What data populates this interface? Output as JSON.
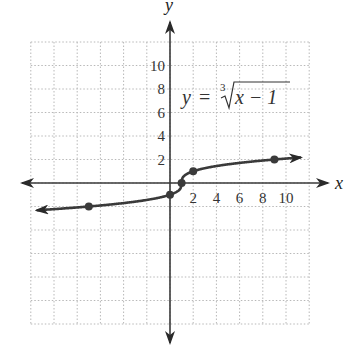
{
  "chart_data": {
    "type": "line",
    "title": "",
    "equation_label": {
      "lhs": "y",
      "equals": "=",
      "index": "3",
      "radicand": "x − 1",
      "full": "y = ∛(x − 1)"
    },
    "xlabel": "x",
    "ylabel": "y",
    "xlim": [
      -12,
      12
    ],
    "ylim": [
      -12,
      12
    ],
    "grid": true,
    "grid_style": "dotted",
    "grid_step": 2,
    "x_ticks": [
      2,
      4,
      6,
      8,
      10
    ],
    "x_tick_labels": [
      "2",
      "4",
      "6",
      "8",
      "10"
    ],
    "y_ticks": [
      2,
      4,
      6,
      8,
      10
    ],
    "y_tick_labels": [
      "2",
      "4",
      "6",
      "8",
      "10"
    ],
    "series": [
      {
        "name": "y = ∛(x − 1)",
        "function": "cbrt(x - 1)",
        "x_range": [
          -11.5,
          11.3
        ],
        "arrows_both_ends": true,
        "color": "#3a3a3a",
        "marked_points": [
          {
            "x": -7,
            "y": -2
          },
          {
            "x": 0,
            "y": -1
          },
          {
            "x": 1,
            "y": 0
          },
          {
            "x": 2,
            "y": 1
          },
          {
            "x": 9,
            "y": 2
          }
        ]
      }
    ]
  },
  "colors": {
    "axis": "#3a3a3a",
    "curve": "#3a3a3a",
    "grid": "#b8b8b8",
    "text": "#333333"
  }
}
